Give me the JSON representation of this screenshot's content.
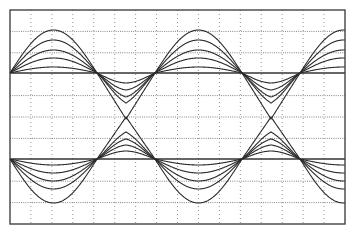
{
  "chart_data": {
    "type": "line",
    "title": "",
    "xlabel": "",
    "ylabel": "",
    "grid": true,
    "legend": null,
    "plot_area": {
      "x0": 10,
      "y0": 10,
      "x1": 345,
      "y1": 224
    },
    "grid_divisions": {
      "x": 16,
      "y": 10
    },
    "waveform": {
      "start_x": 10,
      "period_px": 145,
      "positive_lobe_px": 87,
      "negative_lobe_px": 58,
      "cycles_visible": 2.3
    },
    "series": [
      {
        "name": "upper-family",
        "baseline_y": 73,
        "direction": 1,
        "positive_amplitudes": [
          0,
          6,
          15,
          23,
          33,
          43
        ],
        "negative_amplitudes": [
          0,
          10,
          17,
          24,
          30,
          46
        ],
        "negative_peakiness": [
          0,
          0.1,
          0.25,
          0.4,
          0.6,
          1.0
        ]
      },
      {
        "name": "lower-family",
        "baseline_y": 159,
        "direction": -1,
        "positive_amplitudes": [
          0,
          6,
          14,
          22,
          30,
          44
        ],
        "negative_amplitudes": [
          0,
          8,
          14,
          20,
          27,
          42
        ],
        "negative_peakiness": [
          0,
          0.1,
          0.25,
          0.4,
          0.6,
          1.0
        ]
      }
    ]
  }
}
